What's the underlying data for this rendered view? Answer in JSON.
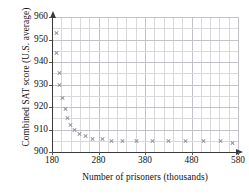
{
  "chart_data": {
    "type": "scatter",
    "title": "",
    "xlabel": "Number of prisoners (thousands)",
    "ylabel": "Combined SAT score (U.S. average)",
    "xlim": [
      180,
      580
    ],
    "ylim": [
      900,
      960
    ],
    "xticks": [
      180,
      280,
      380,
      480,
      580
    ],
    "yticks": [
      900,
      910,
      920,
      930,
      940,
      950,
      960
    ],
    "xtick_labels": [
      "180",
      "280",
      "380",
      "480",
      "580"
    ],
    "ytick_labels": [
      "900",
      "910",
      "920",
      "930",
      "940",
      "950",
      "960"
    ],
    "grid": true,
    "grid_minor_x_step": 20,
    "grid_minor_y_step": 5,
    "legend": null,
    "marker": "x",
    "marker_color": "#8a8a90",
    "axis_color": "#3a3a3a",
    "grid_color": "#d9d9dd",
    "points": [
      {
        "x": 190,
        "y": 953
      },
      {
        "x": 190,
        "y": 944
      },
      {
        "x": 196,
        "y": 935
      },
      {
        "x": 196,
        "y": 930
      },
      {
        "x": 202,
        "y": 924
      },
      {
        "x": 208,
        "y": 919
      },
      {
        "x": 214,
        "y": 915
      },
      {
        "x": 220,
        "y": 912
      },
      {
        "x": 228,
        "y": 910
      },
      {
        "x": 240,
        "y": 908
      },
      {
        "x": 252,
        "y": 907
      },
      {
        "x": 268,
        "y": 906
      },
      {
        "x": 288,
        "y": 906
      },
      {
        "x": 308,
        "y": 905
      },
      {
        "x": 332,
        "y": 905
      },
      {
        "x": 362,
        "y": 905
      },
      {
        "x": 396,
        "y": 905
      },
      {
        "x": 430,
        "y": 905
      },
      {
        "x": 468,
        "y": 905
      },
      {
        "x": 506,
        "y": 905
      },
      {
        "x": 542,
        "y": 905
      },
      {
        "x": 568,
        "y": 904
      }
    ]
  }
}
